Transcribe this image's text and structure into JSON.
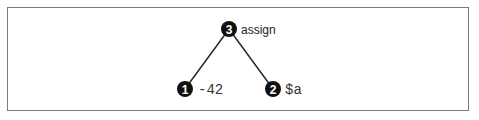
{
  "diagram": {
    "type": "tree",
    "nodes": [
      {
        "id": 3,
        "number": "3",
        "label": "assign",
        "label_style": "sans",
        "x": 229,
        "y": 29
      },
      {
        "id": 1,
        "number": "1",
        "label": "-42",
        "label_style": "mono",
        "x": 185,
        "y": 89
      },
      {
        "id": 2,
        "number": "2",
        "label": "$a",
        "label_style": "mono",
        "x": 273,
        "y": 89
      }
    ],
    "edges": [
      {
        "from": 3,
        "to": 1
      },
      {
        "from": 3,
        "to": 2
      }
    ],
    "colors": {
      "node_fill": "#111111",
      "edge": "#222222",
      "border": "#7a7a7a"
    }
  }
}
